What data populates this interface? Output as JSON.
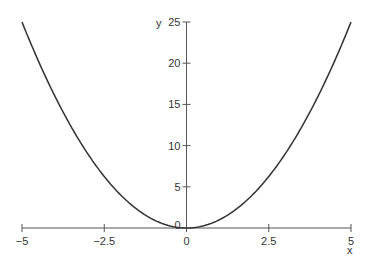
{
  "chart_data": {
    "type": "line",
    "title": "",
    "xlabel": "x",
    "ylabel": "y",
    "xlim": [
      -5,
      5
    ],
    "ylim": [
      0,
      25
    ],
    "grid": false,
    "legend": null,
    "x_ticks": [
      -5,
      -2.5,
      0,
      2.5,
      5
    ],
    "x_tick_labels": [
      "−5",
      "−2.5",
      "0",
      "2.5",
      "5"
    ],
    "y_ticks": [
      0,
      5,
      10,
      15,
      20,
      25
    ],
    "y_tick_labels": [
      "0",
      "5",
      "10",
      "15",
      "20",
      "25"
    ],
    "series": [
      {
        "name": "y = x^2",
        "color": "#333333",
        "x": [
          -5,
          -4.5,
          -4,
          -3.5,
          -3,
          -2.5,
          -2,
          -1.5,
          -1,
          -0.5,
          0,
          0.5,
          1,
          1.5,
          2,
          2.5,
          3,
          3.5,
          4,
          4.5,
          5
        ],
        "y": [
          25,
          20.25,
          16,
          12.25,
          9,
          6.25,
          4,
          2.25,
          1,
          0.25,
          0,
          0.25,
          1,
          2.25,
          4,
          6.25,
          9,
          12.25,
          16,
          20.25,
          25
        ]
      }
    ]
  },
  "colors": {
    "axis": "#555555",
    "curve": "#333333",
    "text": "#333333"
  }
}
